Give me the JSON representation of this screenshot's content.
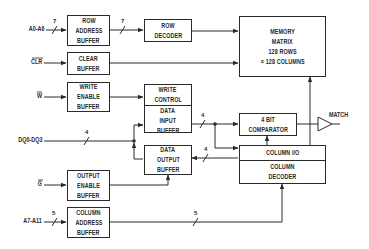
{
  "diagram": {
    "type": "block-diagram",
    "blocks": {
      "row_address_buffer": [
        "ROW",
        "ADDRESS",
        "BUFFER"
      ],
      "row_decoder": [
        "ROW",
        "DECODER"
      ],
      "memory_matrix": [
        "MEMORY",
        "MATRIX",
        "128 ROWS",
        "× 128 COLUMNS"
      ],
      "clear_buffer": [
        "CLEAR",
        "BUFFER"
      ],
      "write_enable_buffer": [
        "WRITE",
        "ENABLE",
        "BUFFER"
      ],
      "write_control": [
        "WRITE",
        "CONTROL"
      ],
      "data_input_buffer": [
        "DATA",
        "INPUT",
        "BUFFER"
      ],
      "data_output_buffer": [
        "DATA",
        "OUTPUT",
        "BUFFER"
      ],
      "comparator": [
        "4 BIT",
        "COMPARATOR"
      ],
      "column_io": [
        "COLUMN I/O"
      ],
      "column_decoder": [
        "COLUMN",
        "DECODER"
      ],
      "output_enable_buffer": [
        "OUTPUT",
        "ENABLE",
        "BUFFER"
      ],
      "column_address_buffer": [
        "COLUMN",
        "ADDRESS",
        "BUFFER"
      ]
    },
    "signals": {
      "a0_a6": "A0-A6",
      "clr": "CLR",
      "w": "W",
      "dq0_dq3": "DQ0-DQ3",
      "g": "G",
      "a7_a11": "A7-A11",
      "match": "MATCH"
    },
    "bus_widths": {
      "a0_a6_in": "7",
      "row_addr_to_decoder": "7",
      "dq_bus": "4",
      "data_in_to_comparator": "4",
      "column_io_to_output": "4",
      "a7_a11_in": "5",
      "column_addr_to_decoder": "5"
    }
  }
}
